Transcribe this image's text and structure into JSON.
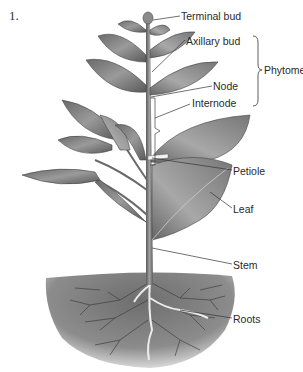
{
  "figure": {
    "number": "1."
  },
  "labels": {
    "terminal_bud": "Terminal bud",
    "axillary_bud": "Axillary bud",
    "phytomer": "Phytomer",
    "node": "Node",
    "internode": "Internode",
    "petiole": "Petiole",
    "leaf": "Leaf",
    "stem": "Stem",
    "roots": "Roots"
  },
  "colors": {
    "leaf_dark": "#5a5a5a",
    "leaf_mid": "#8a8a8a",
    "leaf_light": "#b5b5b5",
    "stem": "#7a7a7a",
    "soil": "#9a9a9a",
    "root": "#e8e8e8",
    "label_line": "#333333",
    "text": "#2a2a2a"
  }
}
